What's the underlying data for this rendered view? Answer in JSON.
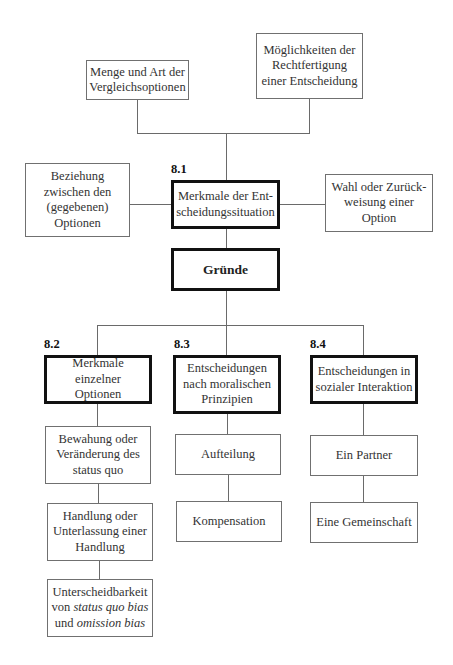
{
  "diagram": {
    "top_left_box": {
      "lines": [
        "Menge und Art der",
        "Vergleichsoptionen"
      ]
    },
    "top_right_box": {
      "lines": [
        "Möglichkeiten der",
        "Rechtfertigung",
        "einer Entscheidung"
      ]
    },
    "left_box": {
      "lines": [
        "Beziehung",
        "zwischen den",
        "(gegebenen)",
        "Optionen"
      ]
    },
    "right_box": {
      "lines": [
        "Wahl oder Zurück-",
        "weisung einer",
        "Option"
      ]
    },
    "center_box": {
      "section": "8.1",
      "lines": [
        "Merkmale der Ent-",
        "scheidungssituation"
      ]
    },
    "root_box": {
      "label": "Gründe"
    },
    "branches": [
      {
        "section": "8.2",
        "lines": [
          "Merkmale einzelner",
          "Optionen"
        ],
        "children": [
          {
            "lines": [
              "Bewahung oder",
              "Veränderung des",
              "status quo"
            ]
          },
          {
            "lines": [
              "Handlung oder",
              "Unterlassung einer",
              "Handlung"
            ]
          },
          {
            "line1": "Unterscheidbarkeit",
            "line2_pre": "von ",
            "line2_em": "status quo bias",
            "line3_pre": "und ",
            "line3_em": "omission bias"
          }
        ]
      },
      {
        "section": "8.3",
        "lines": [
          "Entscheidungen",
          "nach moralischen",
          "Prinzipien"
        ],
        "children": [
          {
            "lines": [
              "Aufteilung"
            ]
          },
          {
            "lines": [
              "Kompensation"
            ]
          }
        ]
      },
      {
        "section": "8.4",
        "lines": [
          "Entscheidungen in",
          "sozialer Interaktion"
        ],
        "children": [
          {
            "lines": [
              "Ein Partner"
            ]
          },
          {
            "lines": [
              "Eine Gemeinschaft"
            ]
          }
        ]
      }
    ]
  }
}
